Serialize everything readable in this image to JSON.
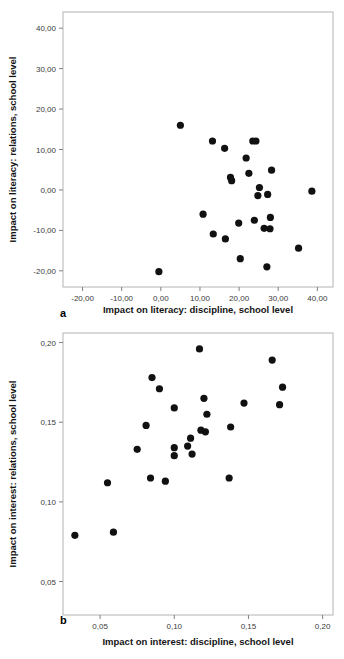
{
  "figures": [
    {
      "panel_letter": "a",
      "chart_data": {
        "type": "scatter",
        "title": "",
        "xlabel": "Impact on literacy: discipline, school level",
        "ylabel": "Impact on literacy: relations, school level",
        "xlim": [
          -25.0,
          44.0
        ],
        "ylim": [
          -24.0,
          44.0
        ],
        "xticks": [
          -20,
          -10,
          0,
          10,
          20,
          30,
          40
        ],
        "xticklabels": [
          "-20,00",
          "-10,00",
          "0,00",
          "10,00",
          "20,00",
          "30,00",
          "40,00"
        ],
        "yticks": [
          -20,
          -10,
          0,
          10,
          20,
          30,
          40
        ],
        "yticklabels": [
          "-20,00",
          "-10,00",
          "0,00",
          "10,00",
          "20,00",
          "30,00",
          "40,00"
        ],
        "grid": false,
        "legend": "none",
        "marker": "filled-circle",
        "marker_color": "#111111",
        "points": [
          {
            "x": 5.0,
            "y": 16.0
          },
          {
            "x": 13.2,
            "y": 12.1
          },
          {
            "x": 16.3,
            "y": 10.3
          },
          {
            "x": 23.5,
            "y": 12.1
          },
          {
            "x": 24.3,
            "y": 12.1
          },
          {
            "x": 21.8,
            "y": 7.9
          },
          {
            "x": 22.5,
            "y": 4.1
          },
          {
            "x": 28.3,
            "y": 4.9
          },
          {
            "x": 17.8,
            "y": 3.1
          },
          {
            "x": 18.1,
            "y": 2.3
          },
          {
            "x": 25.2,
            "y": 0.6
          },
          {
            "x": 38.6,
            "y": -0.3
          },
          {
            "x": 24.8,
            "y": -1.4
          },
          {
            "x": 27.3,
            "y": -1.1
          },
          {
            "x": 10.8,
            "y": -6.0
          },
          {
            "x": 28.0,
            "y": -6.8
          },
          {
            "x": 23.9,
            "y": -7.5
          },
          {
            "x": 19.9,
            "y": -8.2
          },
          {
            "x": 26.4,
            "y": -9.5
          },
          {
            "x": 27.9,
            "y": -9.6
          },
          {
            "x": 13.4,
            "y": -10.9
          },
          {
            "x": 16.5,
            "y": -12.1
          },
          {
            "x": 35.2,
            "y": -14.4
          },
          {
            "x": 20.3,
            "y": -17.0
          },
          {
            "x": 27.1,
            "y": -19.0
          },
          {
            "x": -0.5,
            "y": -20.2
          }
        ]
      }
    },
    {
      "panel_letter": "b",
      "chart_data": {
        "type": "scatter",
        "title": "",
        "xlabel": "Impact on interest: discipline, school level",
        "ylabel": "Impact on interest: relations, school level",
        "xlim": [
          0.025,
          0.207
        ],
        "ylim": [
          0.029,
          0.206
        ],
        "xticks": [
          0.05,
          0.1,
          0.15,
          0.2
        ],
        "xticklabels": [
          "0,05",
          "0,10",
          "0,15",
          "0,20"
        ],
        "yticks": [
          0.05,
          0.1,
          0.15,
          0.2
        ],
        "yticklabels": [
          "0,05",
          "0,10",
          "0,15",
          "0,20"
        ],
        "grid": false,
        "legend": "none",
        "marker": "filled-circle",
        "marker_color": "#111111",
        "points": [
          {
            "x": 0.117,
            "y": 0.196
          },
          {
            "x": 0.166,
            "y": 0.189
          },
          {
            "x": 0.085,
            "y": 0.178
          },
          {
            "x": 0.173,
            "y": 0.172
          },
          {
            "x": 0.09,
            "y": 0.171
          },
          {
            "x": 0.12,
            "y": 0.165
          },
          {
            "x": 0.147,
            "y": 0.162
          },
          {
            "x": 0.171,
            "y": 0.161
          },
          {
            "x": 0.1,
            "y": 0.159
          },
          {
            "x": 0.122,
            "y": 0.155
          },
          {
            "x": 0.081,
            "y": 0.148
          },
          {
            "x": 0.138,
            "y": 0.147
          },
          {
            "x": 0.118,
            "y": 0.145
          },
          {
            "x": 0.121,
            "y": 0.144
          },
          {
            "x": 0.111,
            "y": 0.14
          },
          {
            "x": 0.109,
            "y": 0.135
          },
          {
            "x": 0.1,
            "y": 0.134
          },
          {
            "x": 0.075,
            "y": 0.133
          },
          {
            "x": 0.112,
            "y": 0.13
          },
          {
            "x": 0.1,
            "y": 0.129
          },
          {
            "x": 0.094,
            "y": 0.113
          },
          {
            "x": 0.084,
            "y": 0.115
          },
          {
            "x": 0.137,
            "y": 0.115
          },
          {
            "x": 0.055,
            "y": 0.112
          },
          {
            "x": 0.059,
            "y": 0.081
          },
          {
            "x": 0.033,
            "y": 0.079
          }
        ]
      }
    }
  ]
}
